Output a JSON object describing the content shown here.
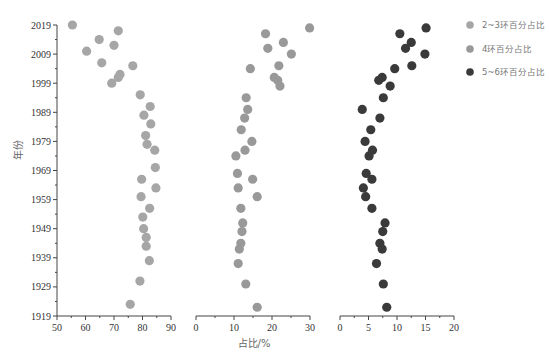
{
  "chart_data": {
    "type": "scatter",
    "title": "",
    "ylabel": "年份",
    "xlabel": "占比/%",
    "ylim": [
      1919,
      2019
    ],
    "y_ticks": [
      2019,
      2009,
      1999,
      1989,
      1979,
      1969,
      1959,
      1949,
      1939,
      1929,
      1919
    ],
    "grid": false,
    "legend_position": "right-top",
    "panels": [
      {
        "name": "2~3环百分占比",
        "color": "#a6a6a6",
        "xlim": [
          50,
          90
        ],
        "x_ticks": [
          50,
          60,
          70,
          80,
          90
        ],
        "points": [
          {
            "year": 2019,
            "value": 55.4
          },
          {
            "year": 2017,
            "value": 71.5
          },
          {
            "year": 2014,
            "value": 64.8
          },
          {
            "year": 2012,
            "value": 70.0
          },
          {
            "year": 2010,
            "value": 60.4
          },
          {
            "year": 2006,
            "value": 65.7
          },
          {
            "year": 2005,
            "value": 76.6
          },
          {
            "year": 2002,
            "value": 72.1
          },
          {
            "year": 2001,
            "value": 71.5
          },
          {
            "year": 1999,
            "value": 69.2
          },
          {
            "year": 1995,
            "value": 79.2
          },
          {
            "year": 1991,
            "value": 82.7
          },
          {
            "year": 1988,
            "value": 80.5
          },
          {
            "year": 1985,
            "value": 82.9
          },
          {
            "year": 1981,
            "value": 81.1
          },
          {
            "year": 1978,
            "value": 81.6
          },
          {
            "year": 1976,
            "value": 84.3
          },
          {
            "year": 1970,
            "value": 84.5
          },
          {
            "year": 1966,
            "value": 79.7
          },
          {
            "year": 1963,
            "value": 84.7
          },
          {
            "year": 1960,
            "value": 79.5
          },
          {
            "year": 1956,
            "value": 82.5
          },
          {
            "year": 1953,
            "value": 80.1
          },
          {
            "year": 1949,
            "value": 80.4
          },
          {
            "year": 1946,
            "value": 81.3
          },
          {
            "year": 1943,
            "value": 81.3
          },
          {
            "year": 1938,
            "value": 82.4
          },
          {
            "year": 1931,
            "value": 79.1
          },
          {
            "year": 1923,
            "value": 75.7
          }
        ]
      },
      {
        "name": "4环百分占比",
        "color": "#999999",
        "xlim": [
          0,
          30
        ],
        "x_ticks": [
          0,
          10,
          20,
          30
        ],
        "points": [
          {
            "year": 2018,
            "value": 29.9
          },
          {
            "year": 2016,
            "value": 18.3
          },
          {
            "year": 2013,
            "value": 23.0
          },
          {
            "year": 2011,
            "value": 18.9
          },
          {
            "year": 2009,
            "value": 25.1
          },
          {
            "year": 2005,
            "value": 21.8
          },
          {
            "year": 2004,
            "value": 14.3
          },
          {
            "year": 2001,
            "value": 20.6
          },
          {
            "year": 2000,
            "value": 21.5
          },
          {
            "year": 1998,
            "value": 22.1
          },
          {
            "year": 1994,
            "value": 13.2
          },
          {
            "year": 1990,
            "value": 13.6
          },
          {
            "year": 1987,
            "value": 12.8
          },
          {
            "year": 1983,
            "value": 11.9
          },
          {
            "year": 1979,
            "value": 14.7
          },
          {
            "year": 1976,
            "value": 12.9
          },
          {
            "year": 1974,
            "value": 10.5
          },
          {
            "year": 1968,
            "value": 10.9
          },
          {
            "year": 1966,
            "value": 14.9
          },
          {
            "year": 1963,
            "value": 11.1
          },
          {
            "year": 1960,
            "value": 16.1
          },
          {
            "year": 1956,
            "value": 11.8
          },
          {
            "year": 1951,
            "value": 12.3
          },
          {
            "year": 1948,
            "value": 12.1
          },
          {
            "year": 1944,
            "value": 11.8
          },
          {
            "year": 1942,
            "value": 11.4
          },
          {
            "year": 1937,
            "value": 11.1
          },
          {
            "year": 1930,
            "value": 13.1
          },
          {
            "year": 1922,
            "value": 16.1
          }
        ]
      },
      {
        "name": "5~6环百分占比",
        "color": "#3a3a3a",
        "xlim": [
          0,
          20
        ],
        "x_ticks": [
          0,
          5,
          10,
          15,
          20
        ],
        "points": [
          {
            "year": 2018,
            "value": 15.1
          },
          {
            "year": 2016,
            "value": 10.5
          },
          {
            "year": 2013,
            "value": 12.5
          },
          {
            "year": 2011,
            "value": 11.5
          },
          {
            "year": 2009,
            "value": 14.9
          },
          {
            "year": 2005,
            "value": 12.6
          },
          {
            "year": 2004,
            "value": 9.6
          },
          {
            "year": 2001,
            "value": 7.4
          },
          {
            "year": 2000,
            "value": 6.8
          },
          {
            "year": 1998,
            "value": 8.8
          },
          {
            "year": 1994,
            "value": 7.6
          },
          {
            "year": 1990,
            "value": 3.9
          },
          {
            "year": 1987,
            "value": 7.0
          },
          {
            "year": 1983,
            "value": 5.4
          },
          {
            "year": 1979,
            "value": 4.4
          },
          {
            "year": 1976,
            "value": 5.7
          },
          {
            "year": 1974,
            "value": 5.1
          },
          {
            "year": 1968,
            "value": 4.6
          },
          {
            "year": 1966,
            "value": 5.6
          },
          {
            "year": 1963,
            "value": 4.1
          },
          {
            "year": 1960,
            "value": 4.5
          },
          {
            "year": 1956,
            "value": 5.6
          },
          {
            "year": 1951,
            "value": 7.9
          },
          {
            "year": 1948,
            "value": 7.5
          },
          {
            "year": 1944,
            "value": 7.0
          },
          {
            "year": 1942,
            "value": 7.4
          },
          {
            "year": 1937,
            "value": 6.4
          },
          {
            "year": 1930,
            "value": 7.6
          },
          {
            "year": 1922,
            "value": 8.2
          }
        ]
      }
    ],
    "legend": [
      {
        "label": "2~3环百分占比",
        "color": "#a6a6a6"
      },
      {
        "label": "4环百分占比",
        "color": "#999999"
      },
      {
        "label": "5~6环百分占比",
        "color": "#3a3a3a"
      }
    ]
  }
}
